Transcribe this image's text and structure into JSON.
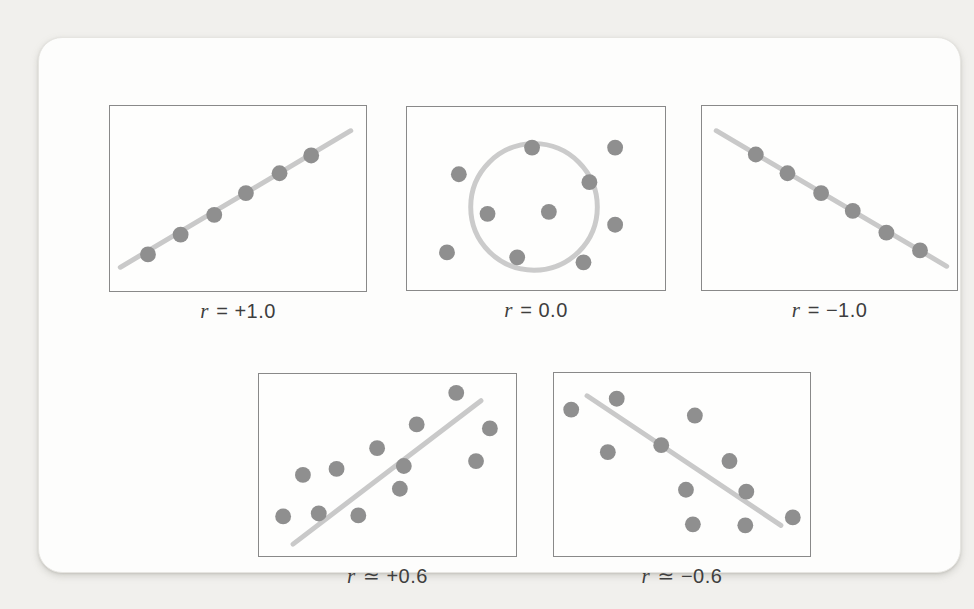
{
  "figure": {
    "page_bg": "#f1f0ed",
    "card_bg": "#fdfdfc"
  },
  "colors": {
    "dot": "#8f8f8f",
    "trend_line": "#c9c9c9",
    "circle": "#cbcbcb",
    "panel_border": "#898989",
    "label_text": "#3e3e3e"
  },
  "chart_data": [
    {
      "type": "scatter",
      "title": "r = +1.0",
      "label_var": "r",
      "label_rest": "= +1.0",
      "r_value": 1.0,
      "legend": "perfect positive correlation",
      "box": {
        "x": 70,
        "y": 67,
        "w": 258,
        "h": 187
      },
      "trend_line": {
        "x1": 10,
        "y1": 163,
        "x2": 243,
        "y2": 25
      },
      "points": [
        [
          38,
          150
        ],
        [
          71,
          130
        ],
        [
          105,
          110
        ],
        [
          137,
          88
        ],
        [
          171,
          68
        ],
        [
          203,
          50
        ]
      ]
    },
    {
      "type": "scatter",
      "title": "r = 0.0",
      "label_var": "r",
      "label_rest": "= 0.0",
      "r_value": 0.0,
      "legend": "no correlation",
      "box": {
        "x": 367,
        "y": 68,
        "w": 260,
        "h": 185
      },
      "circle": {
        "cx": 128,
        "cy": 101,
        "r": 64
      },
      "points": [
        [
          126,
          41
        ],
        [
          210,
          41
        ],
        [
          52,
          68
        ],
        [
          184,
          76
        ],
        [
          81,
          108
        ],
        [
          143,
          106
        ],
        [
          210,
          119
        ],
        [
          40,
          147
        ],
        [
          111,
          152
        ],
        [
          178,
          157
        ]
      ]
    },
    {
      "type": "scatter",
      "title": "r = −1.0",
      "label_var": "r",
      "label_rest": "= −1.0",
      "r_value": -1.0,
      "legend": "perfect negative correlation",
      "box": {
        "x": 662,
        "y": 67,
        "w": 257,
        "h": 186
      },
      "trend_line": {
        "x1": 14,
        "y1": 25,
        "x2": 247,
        "y2": 162
      },
      "points": [
        [
          54,
          49
        ],
        [
          86,
          68
        ],
        [
          120,
          88
        ],
        [
          152,
          106
        ],
        [
          186,
          128
        ],
        [
          220,
          146
        ]
      ]
    },
    {
      "type": "scatter",
      "title": "r ≃ +0.6",
      "label_var": "r",
      "label_rest": "≃ +0.6",
      "r_value": 0.6,
      "legend": "moderate positive correlation",
      "box": {
        "x": 219,
        "y": 335,
        "w": 259,
        "h": 184
      },
      "trend_line": {
        "x1": 34,
        "y1": 172,
        "x2": 224,
        "y2": 27
      },
      "points": [
        [
          199,
          19
        ],
        [
          159,
          51
        ],
        [
          233,
          55
        ],
        [
          119,
          75
        ],
        [
          219,
          88
        ],
        [
          146,
          93
        ],
        [
          78,
          96
        ],
        [
          44,
          102
        ],
        [
          142,
          116
        ],
        [
          60,
          141
        ],
        [
          100,
          143
        ],
        [
          24,
          144
        ]
      ]
    },
    {
      "type": "scatter",
      "title": "r ≃ −0.6",
      "label_var": "r",
      "label_rest": "≃ −0.6",
      "r_value": -0.6,
      "legend": "moderate negative correlation",
      "box": {
        "x": 514,
        "y": 334,
        "w": 258,
        "h": 185
      },
      "trend_line": {
        "x1": 33,
        "y1": 23,
        "x2": 229,
        "y2": 154
      },
      "points": [
        [
          17,
          37
        ],
        [
          63,
          26
        ],
        [
          142,
          43
        ],
        [
          54,
          80
        ],
        [
          108,
          73
        ],
        [
          177,
          89
        ],
        [
          133,
          118
        ],
        [
          194,
          120
        ],
        [
          140,
          153
        ],
        [
          193,
          154
        ],
        [
          241,
          146
        ]
      ]
    }
  ],
  "style": {
    "dot_radius": 8,
    "line_width": 5,
    "circle_width": 5
  }
}
